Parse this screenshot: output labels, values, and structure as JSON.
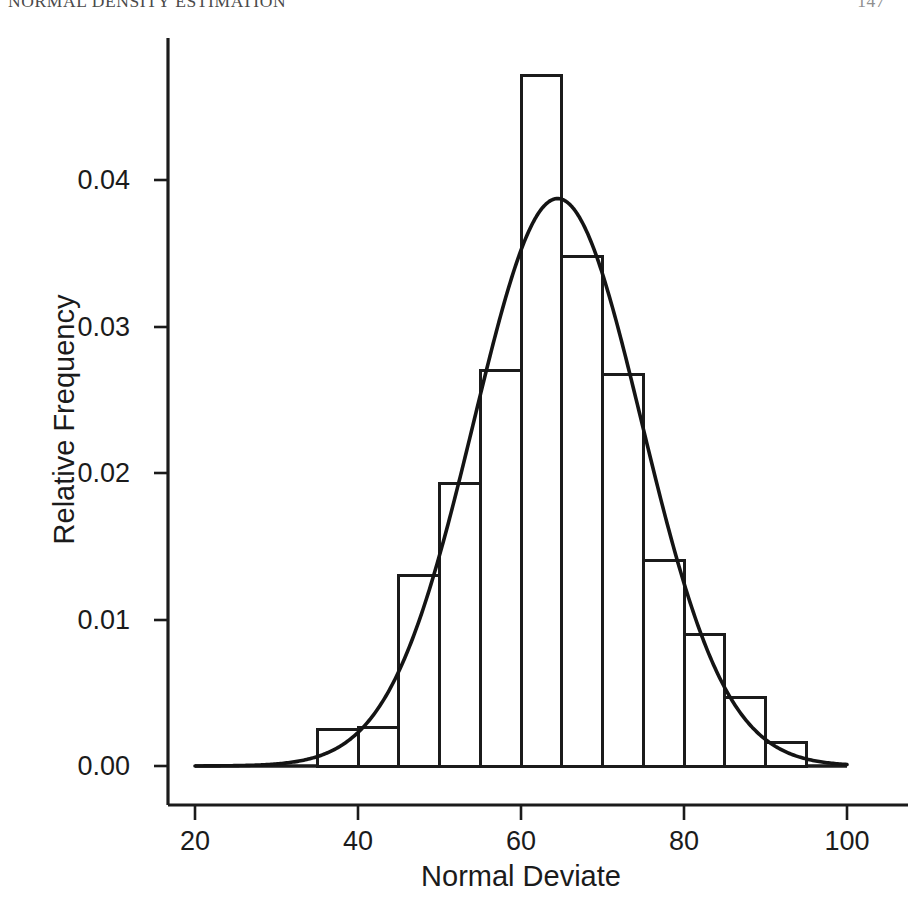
{
  "page": {
    "running_head": "NORMAL DENSITY ESTIMATION",
    "page_number": "147"
  },
  "axis": {
    "x_title": "Normal Deviate",
    "y_title": "Relative Frequency",
    "x_ticks": [
      "20",
      "40",
      "60",
      "80",
      "100"
    ],
    "y_ticks": [
      "0.00",
      "0.01",
      "0.02",
      "0.03",
      "0.04"
    ]
  },
  "colors": {
    "ink": "#1b1b1b",
    "axis": "#1b1b1b",
    "bar_stroke": "#1b1b1b",
    "bar_fill": "#ffffff",
    "curve": "#141414",
    "background": "#ffffff"
  },
  "chart_data": {
    "type": "bar",
    "title": "",
    "subtitle": "",
    "xlabel": "Normal Deviate",
    "ylabel": "Relative Frequency",
    "xlim": [
      20,
      100
    ],
    "ylim": [
      0.0,
      0.05
    ],
    "xticks": [
      20,
      40,
      60,
      80,
      100
    ],
    "yticks": [
      0.0,
      0.01,
      0.02,
      0.03,
      0.04
    ],
    "grid": false,
    "legend": null,
    "bin_width": 5,
    "bin_edges": [
      35,
      40,
      45,
      50,
      55,
      60,
      65,
      70,
      75,
      80,
      85,
      90,
      95
    ],
    "categories": [
      "35-40",
      "40-45",
      "45-50",
      "50-55",
      "55-60",
      "60-65",
      "65-70",
      "70-75",
      "75-80",
      "80-85",
      "85-90",
      "90-95"
    ],
    "bin_centers": [
      37.5,
      42.5,
      47.5,
      52.5,
      57.5,
      62.5,
      67.5,
      72.5,
      77.5,
      82.5,
      87.5,
      92.5
    ],
    "values": [
      0.0025,
      0.0026,
      0.013,
      0.0193,
      0.027,
      0.0471,
      0.0348,
      0.0267,
      0.014,
      0.009,
      0.0047,
      0.0016
    ],
    "series": [
      {
        "name": "Histogram (relative frequency)",
        "type": "bar",
        "values": [
          0.0025,
          0.0026,
          0.013,
          0.0193,
          0.027,
          0.0471,
          0.0348,
          0.0267,
          0.014,
          0.009,
          0.0047,
          0.0016
        ]
      },
      {
        "name": "Fitted normal density",
        "type": "line",
        "distribution": "normal",
        "mean": 64.5,
        "sd": 10.3,
        "peak_value": 0.0388,
        "peak_x": 64.5
      }
    ],
    "annotations": []
  }
}
